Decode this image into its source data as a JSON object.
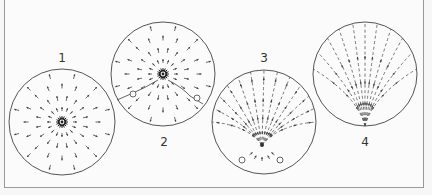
{
  "diagram": {
    "panels": [
      {
        "id": "1",
        "label": "1",
        "cx": 62,
        "cy": 122,
        "r": 53,
        "type": "radial-source",
        "label_x": 62,
        "label_y": 58
      },
      {
        "id": "2",
        "label": "2",
        "cx": 163,
        "cy": 74,
        "r": 52,
        "type": "radial-source-with-two-markers",
        "label_x": 164,
        "label_y": 142
      },
      {
        "id": "3",
        "label": "3",
        "cx": 264,
        "cy": 122,
        "r": 52,
        "type": "fan-from-lower-source",
        "label_x": 264,
        "label_y": 58
      },
      {
        "id": "4",
        "label": "4",
        "cx": 365,
        "cy": 74,
        "r": 52,
        "type": "fan-converging-bottom",
        "label_x": 365,
        "label_y": 142
      }
    ],
    "colors": {
      "line": "#555555",
      "arrow": "#444444",
      "background": "#fbfbfb",
      "frame": "#9a9a9a"
    }
  }
}
